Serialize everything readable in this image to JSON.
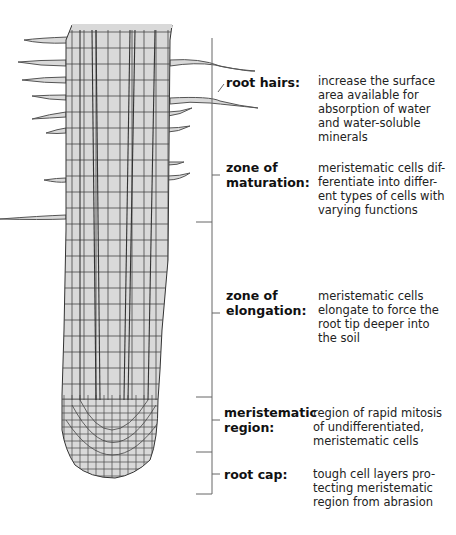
{
  "colors": {
    "cell_fill": "#d9d9d9",
    "cell_stroke": "#333333",
    "bracket": "#666666"
  },
  "zones": [
    {
      "id": "root-hairs",
      "label": "root hairs:",
      "description": "increase the surface area available for absorption of water and water-soluble minerals"
    },
    {
      "id": "zone-of-maturation",
      "label": "zone of maturation:",
      "description": "meristematic cells differentiate into different types of cells with varying functions"
    },
    {
      "id": "zone-of-elongation",
      "label": "zone of elongation:",
      "description": "meristematic cells elongate to force the root tip deeper into the soil"
    },
    {
      "id": "meristematic-region",
      "label": "meristematic region:",
      "description": "region of rapid mitosis of undifferentiated, meristematic cells"
    },
    {
      "id": "root-cap",
      "label": "root cap:",
      "description": "tough cell layers protecting meristematic region from abrasion"
    }
  ],
  "labels": {
    "root_hairs": "root hairs:",
    "maturation_1": "zone of",
    "maturation_2": "maturation:",
    "elongation_1": "zone of",
    "elongation_2": "elongation:",
    "meristematic_1": "meristematic",
    "meristematic_2": "region:",
    "root_cap": "root cap:"
  },
  "descriptions": {
    "root_hairs": [
      "increase the surface",
      "area available for",
      "absorption of water",
      "and water-soluble",
      "minerals"
    ],
    "maturation": [
      "meristematic cells dif-",
      "ferentiate into differ-",
      "ent types of cells with",
      "varying functions"
    ],
    "elongation": [
      "meristematic cells",
      "elongate to force the",
      "root tip deeper into",
      "the soil"
    ],
    "meristematic": [
      "region of rapid mitosis",
      "of undifferentiated,",
      "meristematic cells"
    ],
    "root_cap": [
      "tough cell layers pro-",
      "tecting meristematic",
      "region from abrasion"
    ]
  }
}
